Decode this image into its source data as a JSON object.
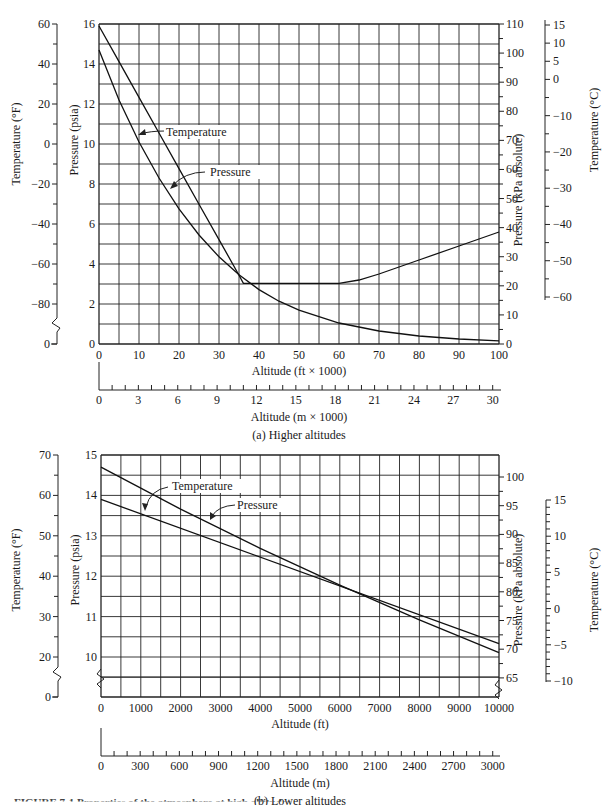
{
  "figure_caption": "FIGURE 7-1  Properties of the atmosphere at high altitudes",
  "chart_data": [
    {
      "id": "upper",
      "type": "line",
      "subtitle": "(a) Higher altitudes",
      "xlabel": "Altitude (ft × 1000)",
      "xlabel2": "Altitude (m × 1000)",
      "ylabel_left_outer": "Temperature (°F)",
      "ylabel_left_inner": "Pressure (psia)",
      "ylabel_right_inner": "Pressure (kPa absolute)",
      "ylabel_right_outer": "Temperature (°C)",
      "xlim": [
        0,
        100
      ],
      "ylim": [
        0,
        16
      ],
      "grid": true,
      "x_ticks": [
        0,
        10,
        20,
        30,
        40,
        50,
        60,
        70,
        80,
        90,
        100
      ],
      "x2_ticks": [
        0,
        3,
        6,
        9,
        12,
        15,
        18,
        21,
        24,
        27,
        30
      ],
      "psia_ticks": [
        0,
        2,
        4,
        6,
        8,
        10,
        12,
        14,
        16
      ],
      "degF_ticks": [
        60,
        40,
        20,
        0,
        -20,
        -40,
        -60,
        -80,
        0
      ],
      "kpa_ticks": [
        110,
        100,
        90,
        80,
        70,
        60,
        50,
        40,
        30,
        20,
        10,
        0
      ],
      "degC_ticks": [
        15,
        10,
        5,
        0,
        -10,
        -20,
        -30,
        -40,
        -50,
        -60
      ],
      "series": [
        {
          "name": "Temperature",
          "axis": "degF",
          "x": [
            0,
            5,
            10,
            15,
            20,
            25,
            30,
            35,
            36.1,
            40,
            50,
            60,
            65,
            70,
            80,
            90,
            100
          ],
          "values": [
            59,
            41.2,
            23.3,
            5.5,
            -12.3,
            -30.1,
            -47.8,
            -65.6,
            -69.7,
            -69.7,
            -69.7,
            -69.7,
            -68,
            -65,
            -58,
            -51,
            -44
          ]
        },
        {
          "name": "Pressure",
          "axis": "psia",
          "x": [
            0,
            5,
            10,
            15,
            20,
            25,
            30,
            35,
            40,
            45,
            50,
            60,
            70,
            80,
            90,
            100
          ],
          "values": [
            14.7,
            12.2,
            10.1,
            8.3,
            6.76,
            5.45,
            4.36,
            3.46,
            2.72,
            2.14,
            1.69,
            1.05,
            0.65,
            0.4,
            0.25,
            0.16
          ]
        }
      ],
      "annotations": [
        {
          "text": "Temperature",
          "points_to": "Temperature"
        },
        {
          "text": "Pressure",
          "points_to": "Pressure"
        }
      ]
    },
    {
      "id": "lower",
      "type": "line",
      "subtitle": "(b) Lower altitudes",
      "xlabel": "Altitude (ft)",
      "xlabel2": "Altitude (m)",
      "ylabel_left_outer": "Temperature (°F)",
      "ylabel_left_inner": "Pressure (psia)",
      "ylabel_right_inner": "Pressure (kPa absolute)",
      "ylabel_right_outer": "Temperature (°C)",
      "xlim": [
        0,
        10000
      ],
      "ylim": [
        9,
        15
      ],
      "grid": true,
      "x_ticks": [
        0,
        1000,
        2000,
        3000,
        4000,
        5000,
        6000,
        7000,
        8000,
        9000,
        10000
      ],
      "x2_ticks": [
        0,
        300,
        600,
        900,
        1200,
        1500,
        1800,
        2100,
        2400,
        2700,
        3000
      ],
      "psia_ticks": [
        10,
        11,
        12,
        13,
        14,
        15
      ],
      "degF_ticks": [
        70,
        60,
        50,
        40,
        30,
        20,
        0
      ],
      "kpa_ticks": [
        100,
        95,
        90,
        85,
        80,
        75,
        70,
        65
      ],
      "degC_ticks": [
        15,
        10,
        5,
        0,
        -5,
        -10
      ],
      "series": [
        {
          "name": "Temperature",
          "axis": "degF",
          "x": [
            0,
            10000
          ],
          "values": [
            59,
            23.3
          ]
        },
        {
          "name": "Pressure",
          "axis": "psia",
          "x": [
            0,
            2000,
            4000,
            6000,
            8000,
            10000
          ],
          "values": [
            14.7,
            13.66,
            12.69,
            11.78,
            10.92,
            10.11
          ]
        }
      ],
      "annotations": [
        {
          "text": "Temperature",
          "points_to": "Temperature"
        },
        {
          "text": "Pressure",
          "points_to": "Pressure"
        }
      ]
    }
  ]
}
